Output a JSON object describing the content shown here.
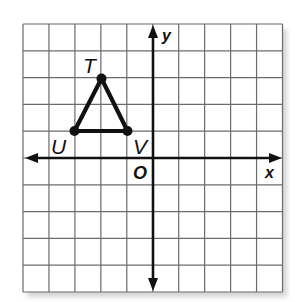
{
  "figure": {
    "type": "coordinate-plane",
    "grid": {
      "columns": 10,
      "rows": 10,
      "x_range": [
        -5,
        5
      ],
      "y_range": [
        -5,
        5
      ]
    },
    "axes": {
      "x_label": "x",
      "y_label": "y",
      "origin_label": "O"
    },
    "triangle": {
      "vertices": [
        {
          "name": "T",
          "x": -2,
          "y": 3
        },
        {
          "name": "U",
          "x": -3,
          "y": 1
        },
        {
          "name": "V",
          "x": -1,
          "y": 1
        }
      ]
    },
    "colors": {
      "grid": "#6b6b6b",
      "axis": "#111111",
      "triangle": "#111111",
      "background": "#ffffff",
      "shadow": "#d9d9d9"
    }
  }
}
